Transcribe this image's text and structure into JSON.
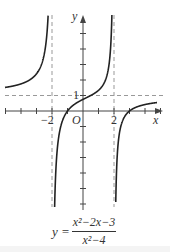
{
  "chart_data": {
    "type": "line",
    "title": "",
    "function": "y = (x^2 - 2x - 3) / (x^2 - 4)",
    "caption": {
      "lhs": "y =",
      "numerator": "x²−2x−3",
      "denominator": "x²−4"
    },
    "xlabel": "x",
    "ylabel": "y",
    "origin_label": "O",
    "tick_labels": {
      "x": [
        "−2",
        "2"
      ],
      "y": [
        "1"
      ]
    },
    "x_ticks": [
      -5,
      -4,
      -3,
      -2,
      -1,
      1,
      2,
      3,
      4,
      5
    ],
    "y_ticks": [
      -6,
      -5,
      -4,
      -3,
      -2,
      -1,
      1,
      2,
      3,
      4,
      5
    ],
    "asymptotes": {
      "vertical": [
        -2,
        2
      ],
      "horizontal": [
        1
      ]
    },
    "xlim": [
      -5.3,
      5.3
    ],
    "ylim": [
      -6.2,
      6.2
    ],
    "grid": false,
    "branches": [
      {
        "name": "left",
        "x_range": [
          -5.3,
          -2.01
        ],
        "sample_points": [
          [
            -5,
            1.52
          ],
          [
            -4,
            1.75
          ],
          [
            -3,
            2.4
          ],
          [
            -2.5,
            3.89
          ],
          [
            -2.2,
            7.24
          ]
        ]
      },
      {
        "name": "middle",
        "x_range": [
          -1.99,
          1.99
        ],
        "sample_points": [
          [
            -1.5,
            -0.43
          ],
          [
            -1,
            0
          ],
          [
            0,
            0.75
          ],
          [
            1,
            1.33
          ],
          [
            1.5,
            2.57
          ]
        ]
      },
      {
        "name": "right",
        "x_range": [
          2.01,
          5.3
        ],
        "sample_points": [
          [
            2.2,
            -3.57
          ],
          [
            2.5,
            -1.56
          ],
          [
            3,
            0
          ],
          [
            4,
            0.42
          ],
          [
            5,
            0.57
          ]
        ]
      }
    ],
    "colors": {
      "curve": "#222222",
      "axis": "#444444",
      "asymptote": "#999999"
    }
  }
}
